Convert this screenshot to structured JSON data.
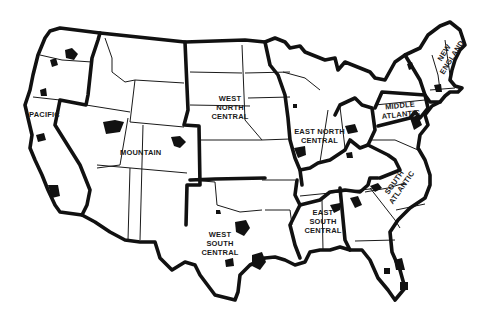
{
  "map": {
    "title": "",
    "colors": {
      "background": "#ffffff",
      "ink": "#111111"
    },
    "divisions": [
      {
        "id": "pacific",
        "label": "PACIFIC"
      },
      {
        "id": "mountain",
        "label": "MOUNTAIN"
      },
      {
        "id": "west-north-central",
        "label": "WEST NORTH CENTRAL",
        "lines": [
          "WEST",
          "NORTH",
          "CENTRAL"
        ]
      },
      {
        "id": "west-south-central",
        "label": "WEST SOUTH CENTRAL",
        "lines": [
          "WEST",
          "SOUTH",
          "CENTRAL"
        ]
      },
      {
        "id": "east-north-central",
        "label": "EAST NORTH CENTRAL",
        "lines": [
          "EAST NORTH",
          "CENTRAL"
        ]
      },
      {
        "id": "east-south-central",
        "label": "EAST SOUTH CENTRAL",
        "lines": [
          "EAST",
          "SOUTH",
          "CENTRAL"
        ]
      },
      {
        "id": "south-atlantic",
        "label": "SOUTH ATLANTIC",
        "lines": [
          "SOUTH",
          "ATLANTIC"
        ]
      },
      {
        "id": "middle-atlantic",
        "label": "MIDDLE ATLANTIC",
        "lines": [
          "MIDDLE",
          "ATLANTIC"
        ]
      },
      {
        "id": "new-england",
        "label": "NEW ENGLAND",
        "lines": [
          "NEW",
          "ENGLAND"
        ]
      }
    ],
    "legend": "Black areas denote metropolitan areas"
  }
}
